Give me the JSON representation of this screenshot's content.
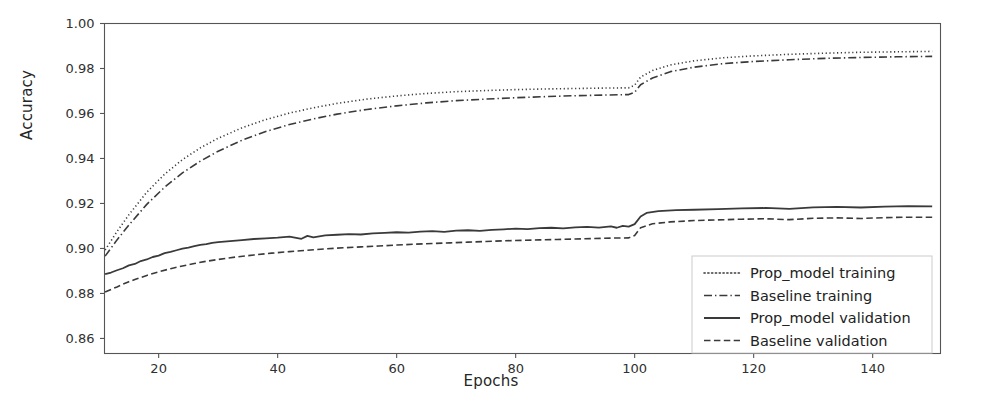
{
  "chart": {
    "type": "line",
    "title": "",
    "xlabel": "Epochs",
    "ylabel": "Accuracy",
    "grid": false,
    "legend_position": "lower right",
    "xlim": [
      10.9,
      151.4
    ],
    "ylim": [
      0.8533,
      1.0
    ],
    "xticks": [
      20,
      40,
      60,
      80,
      100,
      120,
      140
    ],
    "xtick_labels": [
      "20",
      "40",
      "60",
      "80",
      "100",
      "120",
      "140"
    ],
    "yticks": [
      0.86,
      0.88,
      0.9,
      0.92,
      0.94,
      0.96,
      0.98,
      1.0
    ],
    "ytick_labels": [
      "0.86",
      "0.88",
      "0.90",
      "0.92",
      "0.94",
      "0.96",
      "0.98",
      "1.00"
    ],
    "line_color": "#3a3a3a",
    "series": [
      {
        "name": "Prop_model training",
        "style": "dotted",
        "color": "#3a3a3a",
        "width": 1.6,
        "x": [
          11,
          13,
          15,
          18,
          21,
          24,
          27,
          30,
          34,
          38,
          42,
          46,
          50,
          55,
          60,
          65,
          70,
          75,
          80,
          85,
          90,
          95,
          99,
          100,
          101,
          103,
          106,
          110,
          115,
          120,
          126,
          132,
          138,
          144,
          150
        ],
        "y": [
          0.8993,
          0.9075,
          0.915,
          0.925,
          0.933,
          0.9395,
          0.9447,
          0.949,
          0.9536,
          0.9573,
          0.9602,
          0.9625,
          0.9645,
          0.9664,
          0.9678,
          0.9689,
          0.9697,
          0.9702,
          0.9706,
          0.9709,
          0.9711,
          0.9713,
          0.9714,
          0.9726,
          0.9762,
          0.9791,
          0.9816,
          0.9834,
          0.9848,
          0.9856,
          0.9863,
          0.9868,
          0.9872,
          0.9874,
          0.9876
        ]
      },
      {
        "name": "Baseline training",
        "style": "dashdot",
        "color": "#3a3a3a",
        "width": 1.6,
        "x": [
          11,
          13,
          15,
          18,
          21,
          24,
          27,
          30,
          34,
          38,
          42,
          46,
          50,
          55,
          60,
          65,
          70,
          75,
          80,
          85,
          90,
          95,
          99,
          100,
          101,
          103,
          106,
          110,
          115,
          120,
          126,
          132,
          138,
          144,
          150
        ],
        "y": [
          0.8966,
          0.9038,
          0.9104,
          0.9196,
          0.9272,
          0.9336,
          0.9388,
          0.9432,
          0.9481,
          0.952,
          0.9551,
          0.9576,
          0.9597,
          0.9618,
          0.9634,
          0.9647,
          0.9657,
          0.9664,
          0.967,
          0.9675,
          0.9679,
          0.9682,
          0.9684,
          0.9694,
          0.9728,
          0.9758,
          0.9786,
          0.9806,
          0.9822,
          0.9831,
          0.9839,
          0.9845,
          0.9849,
          0.9852,
          0.9854
        ]
      },
      {
        "name": "Prop_model validation",
        "style": "solid",
        "color": "#3a3a3a",
        "width": 1.8,
        "x": [
          11,
          12,
          13,
          14,
          15,
          16,
          17,
          18,
          19,
          20,
          21,
          22,
          23,
          24,
          25,
          26,
          27,
          28,
          29,
          30,
          32,
          34,
          36,
          38,
          40,
          42,
          44,
          45,
          46,
          48,
          50,
          52,
          54,
          56,
          58,
          60,
          62,
          64,
          66,
          68,
          70,
          72,
          74,
          76,
          78,
          80,
          82,
          84,
          86,
          88,
          90,
          92,
          94,
          96,
          97,
          98,
          99,
          100,
          101,
          102,
          104,
          107,
          110,
          114,
          118,
          122,
          126,
          130,
          134,
          138,
          142,
          146,
          150
        ],
        "y": [
          0.8886,
          0.8893,
          0.8903,
          0.8912,
          0.8925,
          0.8931,
          0.8944,
          0.8951,
          0.8962,
          0.8968,
          0.8979,
          0.8985,
          0.8992,
          0.8999,
          0.9004,
          0.901,
          0.9016,
          0.9019,
          0.9025,
          0.9028,
          0.9033,
          0.9037,
          0.9042,
          0.9045,
          0.9048,
          0.9053,
          0.9043,
          0.9056,
          0.9049,
          0.9058,
          0.9061,
          0.9064,
          0.9062,
          0.9067,
          0.9069,
          0.9072,
          0.907,
          0.9075,
          0.9077,
          0.9074,
          0.9079,
          0.9081,
          0.9078,
          0.9083,
          0.9085,
          0.9088,
          0.9086,
          0.909,
          0.9092,
          0.9089,
          0.9094,
          0.9096,
          0.9093,
          0.9098,
          0.9092,
          0.91,
          0.9097,
          0.9108,
          0.9142,
          0.9158,
          0.9166,
          0.917,
          0.9172,
          0.9175,
          0.9178,
          0.918,
          0.9176,
          0.9183,
          0.9185,
          0.9182,
          0.9186,
          0.9188,
          0.9187
        ]
      },
      {
        "name": "Baseline validation",
        "style": "dashed",
        "color": "#3a3a3a",
        "width": 1.6,
        "x": [
          11,
          12,
          13,
          14,
          15,
          16,
          18,
          20,
          22,
          24,
          26,
          28,
          30,
          33,
          36,
          39,
          42,
          45,
          48,
          51,
          54,
          57,
          60,
          63,
          66,
          69,
          72,
          75,
          78,
          81,
          84,
          87,
          90,
          93,
          96,
          99,
          100,
          101,
          103,
          106,
          110,
          114,
          118,
          122,
          126,
          130,
          134,
          138,
          142,
          146,
          150
        ],
        "y": [
          0.8806,
          0.8818,
          0.8829,
          0.8841,
          0.8852,
          0.8862,
          0.888,
          0.8896,
          0.891,
          0.8922,
          0.8933,
          0.8943,
          0.8951,
          0.8962,
          0.8971,
          0.8979,
          0.8986,
          0.8992,
          0.8998,
          0.9003,
          0.9007,
          0.9011,
          0.9015,
          0.9019,
          0.9022,
          0.9025,
          0.9028,
          0.9031,
          0.9034,
          0.9036,
          0.9038,
          0.904,
          0.9042,
          0.9044,
          0.9046,
          0.9047,
          0.9058,
          0.9092,
          0.911,
          0.9118,
          0.9124,
          0.9127,
          0.913,
          0.9132,
          0.9128,
          0.9134,
          0.9136,
          0.9133,
          0.9137,
          0.9139,
          0.9139
        ]
      }
    ]
  }
}
